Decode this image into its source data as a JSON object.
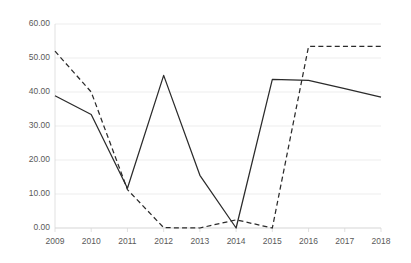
{
  "chart_data": {
    "type": "line",
    "title": "",
    "subtitle": "",
    "xlabel": "",
    "ylabel": "",
    "x": [
      2009,
      2010,
      2011,
      2012,
      2013,
      2014,
      2015,
      2016,
      2017,
      2018
    ],
    "categories": [
      "2009",
      "2010",
      "2011",
      "2012",
      "2013",
      "2014",
      "2015",
      "2016",
      "2017",
      "2018"
    ],
    "xlim": [
      2009,
      2018
    ],
    "ylim": [
      0,
      60
    ],
    "ytick_values": [
      0,
      10,
      20,
      30,
      40,
      50,
      60
    ],
    "ytick_labels": [
      "0.00",
      "10.00",
      "20.00",
      "30.00",
      "40.00",
      "50.00",
      "60.00"
    ],
    "grid": "horizontal",
    "legend": "none",
    "series": [
      {
        "name": "series-1",
        "style": "solid",
        "color": "#2b2b2b",
        "values": [
          38.9,
          33.4,
          11.7,
          44.9,
          15.5,
          0.0,
          43.7,
          43.4,
          41.0,
          38.5
        ]
      },
      {
        "name": "series-2",
        "style": "dashed",
        "color": "#2b2b2b",
        "values": [
          52.0,
          40.0,
          11.3,
          0.1,
          0.0,
          2.4,
          0.0,
          53.4,
          53.4,
          53.4
        ]
      }
    ]
  },
  "axes": {
    "y_labels": [
      "60.00",
      "50.00",
      "40.00",
      "30.00",
      "20.00",
      "10.00",
      "0.00"
    ],
    "x_labels": [
      "2009",
      "2010",
      "2011",
      "2012",
      "2013",
      "2014",
      "2015",
      "2016",
      "2017",
      "2018"
    ]
  }
}
